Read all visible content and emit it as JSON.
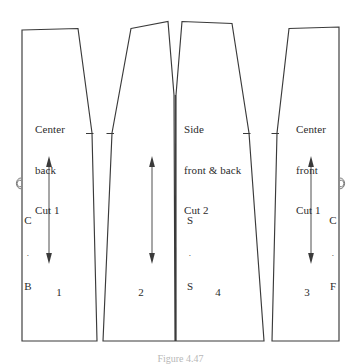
{
  "figure": {
    "background_color": "#ffffff",
    "line_color": "#3a3a3a",
    "text_color": "#2b2b2b",
    "caption": "Figure 4.47"
  },
  "pieces": [
    {
      "id": "center-back",
      "number": "1",
      "title_lines": [
        "Center",
        "back",
        "Cut 1"
      ],
      "edge_code": {
        "top": "C",
        "dot": ".",
        "bottom": "B",
        "meaning": "center back"
      },
      "fold_symbol": "fold-on-edge",
      "grainline": "double-arrow",
      "notches": 1
    },
    {
      "id": "side-panel-left",
      "number": "2",
      "title_lines": [],
      "edge_code": null,
      "fold_symbol": null,
      "grainline": "double-arrow",
      "notches": 1
    },
    {
      "id": "side-front-and-back",
      "number": "4",
      "title_lines": [
        "Side",
        "front & back",
        "Cut 2"
      ],
      "edge_code": {
        "top": "S",
        "dot": ".",
        "bottom": "S",
        "meaning": "side seam"
      },
      "fold_symbol": null,
      "grainline": null,
      "notches": 1
    },
    {
      "id": "center-front",
      "number": "3",
      "title_lines": [
        "Center",
        "front",
        "Cut 1"
      ],
      "edge_code": {
        "top": "C",
        "dot": ".",
        "bottom": "F",
        "meaning": "center front"
      },
      "fold_symbol": "fold-on-edge",
      "grainline": "double-arrow",
      "notches": 1
    }
  ],
  "labels": {
    "center_back_line1": "Center",
    "center_back_line2": "back",
    "center_back_line3": "Cut 1",
    "side_line1": "Side",
    "side_line2": "front & back",
    "side_line3": "Cut 2",
    "center_front_line1": "Center",
    "center_front_line2": "front",
    "center_front_line3": "Cut 1",
    "cb_top": "C",
    "cb_dot": ".",
    "cb_bottom": "B",
    "ss_top": "S",
    "ss_dot": ".",
    "ss_bottom": "S",
    "cf_top": "C",
    "cf_dot": ".",
    "cf_bottom": "F",
    "number_1": "1",
    "number_2": "2",
    "number_4": "4",
    "number_3": "3"
  }
}
